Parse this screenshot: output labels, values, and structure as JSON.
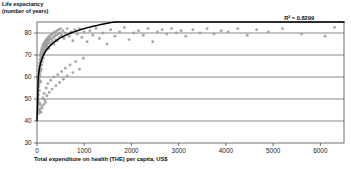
{
  "chart_data": {
    "type": "scatter",
    "title": "",
    "xlabel": "Total expenditure on health (THE) per capita, US$",
    "ylabel": "Life expectancy\n(number of years)",
    "ylabel_line1": "Life expectancy",
    "ylabel_line2": "(number of years)",
    "xlim": [
      0,
      6500
    ],
    "ylim": [
      30,
      85
    ],
    "xticks": [
      0,
      1000,
      2000,
      3000,
      4000,
      5000,
      6000
    ],
    "xtick_labels": [
      "0",
      "1000",
      "2000",
      "3000",
      "4000",
      "5000",
      "6000"
    ],
    "yticks": [
      30,
      40,
      50,
      60,
      70,
      80
    ],
    "ytick_labels": [
      "30",
      "40",
      "50",
      "60",
      "70",
      "80"
    ],
    "grid": "horizontal",
    "legend": "none",
    "annotations": [
      {
        "name": "r-squared",
        "text": "R² = 0.8299",
        "x": 5700,
        "y": 84
      }
    ],
    "marker_color": "#9a9a9a",
    "trendline_color": "#000000",
    "trendline_type": "logarithmic",
    "trendline_equation_a": 6.05,
    "trendline_equation_b": 40.2,
    "series": [
      {
        "name": "Countries",
        "points": [
          [
            12,
            48.5
          ],
          [
            15,
            51.0
          ],
          [
            18,
            46.5
          ],
          [
            20,
            53.5
          ],
          [
            22,
            50.0
          ],
          [
            24,
            57.0
          ],
          [
            26,
            49.0
          ],
          [
            28,
            55.5
          ],
          [
            30,
            60.0
          ],
          [
            32,
            52.0
          ],
          [
            34,
            58.5
          ],
          [
            36,
            62.0
          ],
          [
            38,
            47.5
          ],
          [
            40,
            56.0
          ],
          [
            42,
            63.5
          ],
          [
            45,
            59.0
          ],
          [
            47,
            65.0
          ],
          [
            50,
            54.0
          ],
          [
            52,
            61.5
          ],
          [
            55,
            66.5
          ],
          [
            58,
            57.5
          ],
          [
            60,
            63.0
          ],
          [
            62,
            68.0
          ],
          [
            65,
            60.5
          ],
          [
            68,
            64.5
          ],
          [
            70,
            69.5
          ],
          [
            72,
            62.5
          ],
          [
            75,
            66.0
          ],
          [
            78,
            70.5
          ],
          [
            80,
            58.0
          ],
          [
            85,
            67.5
          ],
          [
            88,
            71.5
          ],
          [
            90,
            63.5
          ],
          [
            95,
            69.0
          ],
          [
            98,
            72.5
          ],
          [
            100,
            65.5
          ],
          [
            105,
            70.0
          ],
          [
            110,
            73.5
          ],
          [
            115,
            67.0
          ],
          [
            120,
            71.0
          ],
          [
            125,
            74.5
          ],
          [
            130,
            68.5
          ],
          [
            135,
            72.0
          ],
          [
            140,
            75.0
          ],
          [
            145,
            70.0
          ],
          [
            150,
            73.0
          ],
          [
            155,
            75.5
          ],
          [
            160,
            71.5
          ],
          [
            165,
            74.0
          ],
          [
            170,
            76.0
          ],
          [
            175,
            72.5
          ],
          [
            180,
            74.5
          ],
          [
            185,
            76.5
          ],
          [
            190,
            73.5
          ],
          [
            195,
            75.0
          ],
          [
            200,
            77.0
          ],
          [
            210,
            74.0
          ],
          [
            215,
            76.0
          ],
          [
            220,
            77.5
          ],
          [
            230,
            75.0
          ],
          [
            235,
            77.0
          ],
          [
            240,
            78.0
          ],
          [
            250,
            73.0
          ],
          [
            255,
            76.5
          ],
          [
            260,
            78.5
          ],
          [
            270,
            75.5
          ],
          [
            280,
            77.5
          ],
          [
            290,
            79.0
          ],
          [
            300,
            74.5
          ],
          [
            310,
            77.0
          ],
          [
            320,
            79.5
          ],
          [
            330,
            76.0
          ],
          [
            340,
            78.0
          ],
          [
            350,
            80.0
          ],
          [
            360,
            75.0
          ],
          [
            370,
            78.5
          ],
          [
            380,
            80.5
          ],
          [
            395,
            77.0
          ],
          [
            405,
            79.0
          ],
          [
            420,
            81.0
          ],
          [
            430,
            76.5
          ],
          [
            445,
            79.5
          ],
          [
            460,
            81.5
          ],
          [
            475,
            78.0
          ],
          [
            490,
            80.0
          ],
          [
            500,
            82.0
          ],
          [
            125,
            50.5
          ],
          [
            150,
            52.5
          ],
          [
            165,
            49.5
          ],
          [
            195,
            55.0
          ],
          [
            210,
            51.5
          ],
          [
            230,
            57.0
          ],
          [
            260,
            53.0
          ],
          [
            290,
            58.5
          ],
          [
            320,
            54.5
          ],
          [
            360,
            60.0
          ],
          [
            400,
            56.0
          ],
          [
            440,
            61.0
          ],
          [
            480,
            57.5
          ],
          [
            520,
            62.5
          ],
          [
            560,
            59.0
          ],
          [
            600,
            64.0
          ],
          [
            640,
            60.5
          ],
          [
            700,
            65.5
          ],
          [
            760,
            62.0
          ],
          [
            820,
            67.0
          ],
          [
            900,
            63.5
          ],
          [
            980,
            68.5
          ],
          [
            520,
            79.0
          ],
          [
            545,
            81.0
          ],
          [
            570,
            77.5
          ],
          [
            600,
            80.0
          ],
          [
            640,
            82.0
          ],
          [
            680,
            78.5
          ],
          [
            720,
            80.5
          ],
          [
            760,
            76.5
          ],
          [
            800,
            81.5
          ],
          [
            850,
            79.5
          ],
          [
            900,
            82.0
          ],
          [
            950,
            78.0
          ],
          [
            1000,
            80.5
          ],
          [
            1060,
            76.0
          ],
          [
            1120,
            81.0
          ],
          [
            1180,
            79.0
          ],
          [
            1250,
            82.0
          ],
          [
            1320,
            77.5
          ],
          [
            1400,
            80.0
          ],
          [
            1480,
            75.0
          ],
          [
            1560,
            81.5
          ],
          [
            1650,
            78.5
          ],
          [
            1750,
            80.5
          ],
          [
            1850,
            82.5
          ],
          [
            1950,
            77.0
          ],
          [
            2050,
            80.0
          ],
          [
            2150,
            81.0
          ],
          [
            2250,
            79.0
          ],
          [
            2350,
            82.0
          ],
          [
            2450,
            76.0
          ],
          [
            2550,
            80.5
          ],
          [
            2650,
            81.5
          ],
          [
            2750,
            79.5
          ],
          [
            2850,
            82.0
          ],
          [
            2950,
            80.0
          ],
          [
            3050,
            81.0
          ],
          [
            3150,
            78.5
          ],
          [
            3300,
            81.5
          ],
          [
            3450,
            80.0
          ],
          [
            3600,
            82.0
          ],
          [
            3750,
            79.5
          ],
          [
            3900,
            81.0
          ],
          [
            4050,
            80.5
          ],
          [
            4250,
            82.0
          ],
          [
            4450,
            79.0
          ],
          [
            4650,
            81.5
          ],
          [
            4900,
            80.5
          ],
          [
            5200,
            82.0
          ],
          [
            5600,
            79.5
          ],
          [
            6100,
            78.5
          ],
          [
            6300,
            82.5
          ],
          [
            55,
            44.5
          ],
          [
            70,
            45.5
          ],
          [
            95,
            47.0
          ],
          [
            40,
            43.5
          ],
          [
            30,
            45.0
          ],
          [
            60,
            48.0
          ],
          [
            85,
            44.0
          ],
          [
            110,
            46.0
          ],
          [
            180,
            48.5
          ],
          [
            145,
            47.5
          ]
        ]
      }
    ]
  }
}
